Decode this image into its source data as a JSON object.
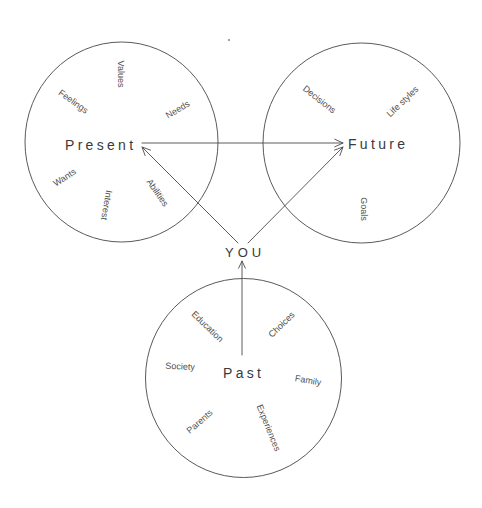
{
  "diagram": {
    "center_label": "YOU",
    "circles": {
      "present": {
        "title": "Present",
        "items": [
          "Values",
          "Feelings",
          "Needs",
          "Wants",
          "Interest",
          "Abilities"
        ]
      },
      "future": {
        "title": "Future",
        "items": [
          "Decisions",
          "Life styles",
          "Goals"
        ]
      },
      "past": {
        "title": "Past",
        "items": [
          "Education",
          "Choices",
          "Society",
          "Family",
          "Parents",
          "Experiences"
        ]
      }
    },
    "arrows": [
      {
        "from": "Present",
        "to": "Future"
      },
      {
        "from": "YOU",
        "to": "Present"
      },
      {
        "from": "YOU",
        "to": "Future"
      },
      {
        "from": "Past",
        "to": "YOU"
      }
    ],
    "colors": {
      "stroke": "#4a4a4a",
      "text": "#3a3a3a",
      "background": "#ffffff"
    }
  }
}
